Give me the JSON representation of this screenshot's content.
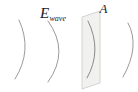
{
  "diagram": {
    "labels": {
      "field_symbol": "E",
      "field_subscript": "wave",
      "aperture": "A"
    },
    "colors": {
      "background": "#ffffff",
      "wavefront_stroke": "#9a9a9a",
      "aperture_wavefront_stroke": "#8a8a8a",
      "aperture_fill": "#f1f1ef",
      "aperture_border": "#c8c8c6",
      "label_color": "#1c1c1c"
    }
  }
}
